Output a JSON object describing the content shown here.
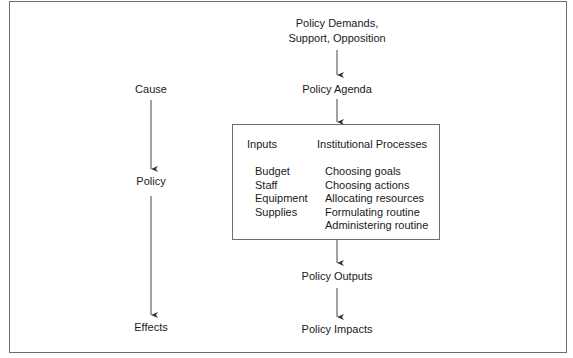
{
  "diagram": {
    "type": "policy-process-flow",
    "left_column": {
      "nodes": [
        "Cause",
        "Policy",
        "Effects"
      ]
    },
    "right_column": {
      "top_node": "Policy Demands,\nSupport, Opposition",
      "top_node_line1": "Policy Demands,",
      "top_node_line2": "Support, Opposition",
      "agenda": "Policy Agenda",
      "box": {
        "inputs_header": "Inputs",
        "processes_header": "Institutional Processes",
        "inputs": [
          "Budget",
          "Staff",
          "Equipment",
          "Supplies"
        ],
        "processes": [
          "Choosing goals",
          "Choosing actions",
          "Allocating resources",
          "Formulating routine",
          "Administering routine"
        ]
      },
      "outputs": "Policy Outputs",
      "impacts": "Policy Impacts"
    },
    "edges": [
      {
        "from": "Cause",
        "to": "Policy"
      },
      {
        "from": "Policy",
        "to": "Effects"
      },
      {
        "from": "Policy Demands, Support, Opposition",
        "to": "Policy Agenda"
      },
      {
        "from": "Policy Agenda",
        "to": "Inputs/Institutional Processes"
      },
      {
        "from": "Inputs/Institutional Processes",
        "to": "Policy Outputs"
      },
      {
        "from": "Policy Outputs",
        "to": "Policy Impacts"
      }
    ]
  }
}
